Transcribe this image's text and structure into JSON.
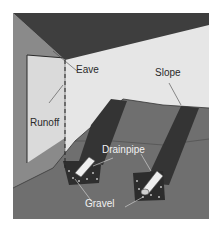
{
  "diagram": {
    "type": "illustration",
    "labels": {
      "eave": "Eave",
      "runoff": "Runoff",
      "slope": "Slope",
      "drainpipe": "Drainpipe",
      "gravel": "Gravel"
    },
    "colors": {
      "roof": "#3e3e3e",
      "wall_left": "#8a8a8a",
      "wall_panel": "#d9d9d9",
      "back_wall": "#e6e6e6",
      "ground": "#6f6f6f",
      "trench": "#3a3a3a",
      "pipe": "#efefef",
      "gravel": "#2c2c2c"
    }
  }
}
